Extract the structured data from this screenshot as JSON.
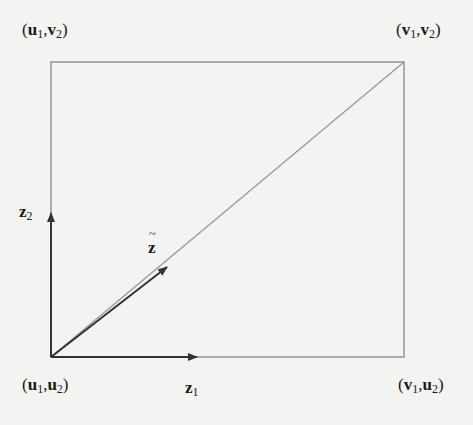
{
  "diagram": {
    "type": "rectangle-with-diagonal-and-vectors",
    "corners": {
      "top_left": {
        "var1": "u",
        "sub1": "1",
        "var2": "v",
        "sub2": "2"
      },
      "top_right": {
        "var1": "v",
        "sub1": "1",
        "var2": "v",
        "sub2": "2"
      },
      "bottom_left": {
        "var1": "u",
        "sub1": "1",
        "var2": "u",
        "sub2": "2"
      },
      "bottom_right": {
        "var1": "v",
        "sub1": "1",
        "var2": "u",
        "sub2": "2"
      }
    },
    "vectors": {
      "z1": {
        "var": "z",
        "sub": "1"
      },
      "z2": {
        "var": "z",
        "sub": "2"
      },
      "z_tilde": {
        "var": "z"
      }
    },
    "punct": {
      "open": "(",
      "comma": ",",
      "close": ")"
    },
    "colors": {
      "background": "#f3f3f1",
      "rect_stroke": "#9a9a9a",
      "arrow_stroke": "#333333",
      "text": "#1a1a1a"
    }
  }
}
